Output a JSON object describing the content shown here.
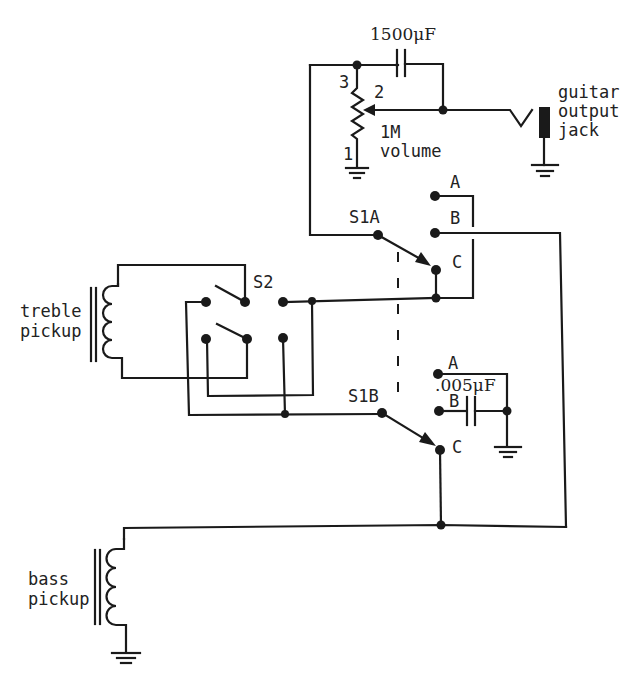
{
  "diagram": {
    "components": {
      "capacitor_main": {
        "label": "1500μF"
      },
      "volume_pot": {
        "value_label": "1M",
        "name_label": "volume",
        "pin_labels": [
          "1",
          "2",
          "3"
        ]
      },
      "output_jack": {
        "label_lines": [
          "guitar",
          "output",
          "jack"
        ]
      },
      "switch_s1a": {
        "label": "S1A",
        "positions": [
          "A",
          "B",
          "C"
        ]
      },
      "switch_s1b": {
        "label": "S1B",
        "positions": [
          "A",
          "B",
          "C"
        ]
      },
      "switch_s2": {
        "label": "S2"
      },
      "capacitor_tone": {
        "label": ".005μF"
      },
      "treble_pickup": {
        "label_lines": [
          "treble",
          "pickup"
        ]
      },
      "bass_pickup": {
        "label_lines": [
          "bass",
          "pickup"
        ]
      }
    },
    "colors": {
      "ink": "#1a1a1a",
      "background": "#ffffff"
    }
  }
}
